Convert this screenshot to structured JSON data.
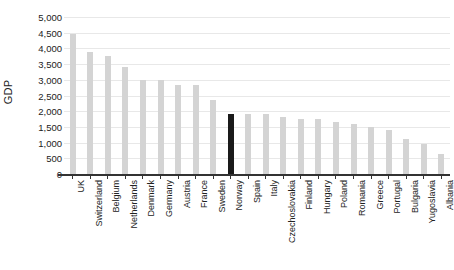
{
  "chart_data": {
    "type": "bar",
    "title": "",
    "xlabel": "",
    "ylabel": "GDP",
    "ylim": [
      0,
      5000
    ],
    "grid": true,
    "legend": "none",
    "highlight_category": "Norway",
    "highlight_color": "#1a1a1a",
    "bar_color": "#d4d4d4",
    "categories": [
      "UK",
      "Switzerland",
      "Belgium",
      "Netherlands",
      "Denmark",
      "Germany",
      "Austria",
      "France",
      "Sweden",
      "Norway",
      "Spain",
      "Italy",
      "Czechoslovakia",
      "Finland",
      "Hungary",
      "Poland",
      "Romania",
      "Greece",
      "Portugal",
      "Bulgaria",
      "Yugoslavia",
      "Albania"
    ],
    "values": [
      4450,
      3900,
      3750,
      3400,
      3000,
      3000,
      2850,
      2850,
      2350,
      1900,
      1900,
      1900,
      1800,
      1750,
      1750,
      1650,
      1600,
      1500,
      1400,
      1100,
      950,
      650
    ],
    "y_ticks": [
      "5,000",
      "4,500",
      "4,000",
      "3,500",
      "3,000",
      "2,500",
      "2,000",
      "1,500",
      "1,000",
      "500",
      "0"
    ],
    "y_tick_values": [
      5000,
      4500,
      4000,
      3500,
      3000,
      2500,
      2000,
      1500,
      1000,
      500,
      0
    ]
  }
}
